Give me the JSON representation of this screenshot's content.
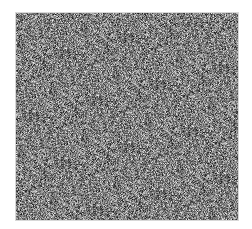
{
  "image": {
    "description": "grayscale noise texture patch",
    "palette": {
      "background": "#ffffff",
      "mid_gray": "#808080",
      "border": "#d8d8d8"
    },
    "region": {
      "x": 15,
      "y": 12,
      "width": 224,
      "height": 209
    }
  }
}
